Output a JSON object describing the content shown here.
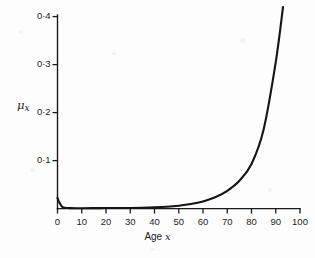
{
  "figure": {
    "background_color": "#fdfdfd",
    "ink_color": "#1a1a1a"
  },
  "axis_titles": {
    "y_mu": "μ",
    "y_sub": "x",
    "x_prefix": "Age ",
    "x_variable": "x"
  },
  "chart_data": {
    "type": "line",
    "title": "",
    "subtitle": "",
    "xlabel": "Age x",
    "ylabel": "μx",
    "xlim": [
      0,
      100
    ],
    "ylim": [
      0,
      0.43
    ],
    "grid": false,
    "legend": null,
    "x_tick_labels": [
      "0",
      "10",
      "20",
      "30",
      "40",
      "50",
      "60",
      "70",
      "80",
      "90",
      "100"
    ],
    "x_ticks": [
      0,
      10,
      20,
      30,
      40,
      50,
      60,
      70,
      80,
      90,
      100
    ],
    "y_tick_labels": [
      "0·1",
      "0·2",
      "0·3",
      "0·4"
    ],
    "y_ticks": [
      0.1,
      0.2,
      0.3,
      0.4
    ],
    "decimal_separator": "·",
    "series": [
      {
        "name": "force of mortality",
        "x": [
          0,
          0.5,
          1,
          1.5,
          2,
          3,
          4,
          5,
          10,
          15,
          20,
          25,
          30,
          35,
          40,
          45,
          50,
          55,
          60,
          65,
          70,
          75,
          80,
          85,
          90,
          93
        ],
        "values": [
          0.0225,
          0.0155,
          0.0105,
          0.0065,
          0.0035,
          0.0016,
          0.0012,
          0.001,
          0.0008,
          0.0009,
          0.0011,
          0.0012,
          0.0014,
          0.0018,
          0.0025,
          0.0038,
          0.006,
          0.0095,
          0.015,
          0.0235,
          0.037,
          0.058,
          0.093,
          0.165,
          0.305,
          0.42
        ]
      }
    ]
  }
}
